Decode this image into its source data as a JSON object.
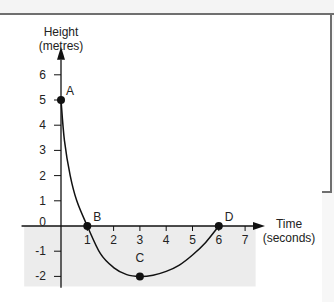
{
  "chart_data": {
    "type": "line",
    "title": "",
    "ylabel_lines": [
      "Height",
      "(metres)"
    ],
    "xlabel_lines": [
      "Time",
      "(seconds)"
    ],
    "xlim": [
      0,
      7
    ],
    "ylim": [
      -2,
      6
    ],
    "x_ticks": [
      1,
      2,
      3,
      4,
      5,
      6,
      7
    ],
    "y_ticks": [
      6,
      5,
      4,
      3,
      2,
      1,
      0,
      -1,
      -2
    ],
    "y_tick_labels": [
      "6",
      "5",
      "4",
      "3",
      "2",
      "1",
      "0",
      "-1",
      "-2"
    ],
    "x_tick_labels": [
      "1",
      "2",
      "3",
      "4",
      "5",
      "6",
      "7"
    ],
    "series": [
      {
        "name": "height",
        "x": [
          0,
          0.13,
          0.35,
          0.6,
          1,
          1.5,
          2,
          2.5,
          3,
          3.5,
          4,
          4.5,
          5,
          5.5,
          6
        ],
        "y": [
          5,
          3.4,
          2,
          1,
          0,
          -1.1,
          -1.65,
          -1.93,
          -2,
          -1.95,
          -1.8,
          -1.55,
          -1.15,
          -0.65,
          0
        ]
      }
    ],
    "points": [
      {
        "label": "A",
        "x": 0,
        "y": 5
      },
      {
        "label": "B",
        "x": 1,
        "y": 0
      },
      {
        "label": "C",
        "x": 3,
        "y": -2
      },
      {
        "label": "D",
        "x": 6,
        "y": 0
      }
    ],
    "shaded_region": {
      "x_from": -1.4,
      "x_to": 7.4,
      "y_from": 0,
      "y_to": -2.4
    },
    "grid": false,
    "colors": {
      "line": "#111111",
      "shade": "#ececec",
      "axis": "#111111"
    }
  }
}
